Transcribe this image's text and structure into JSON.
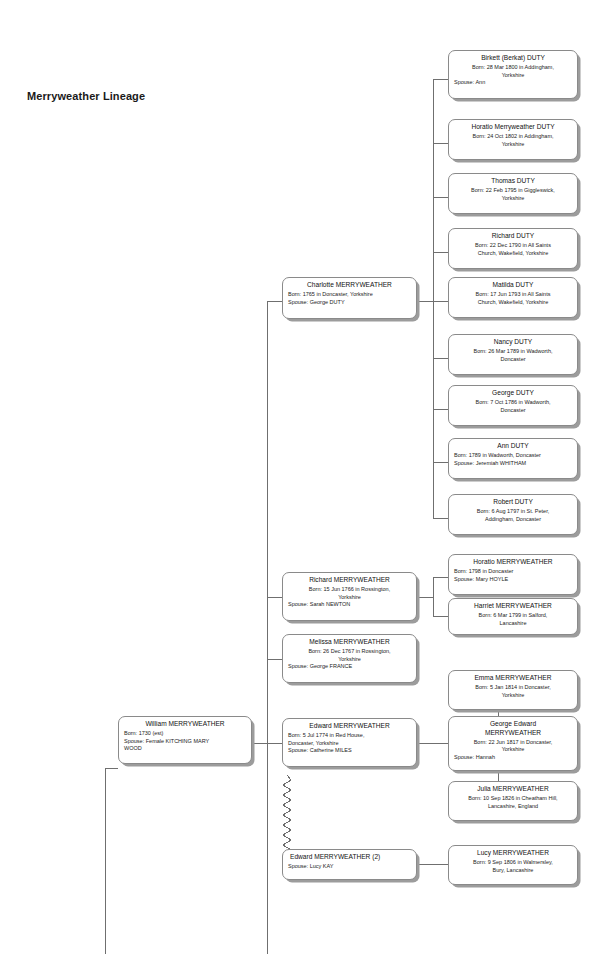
{
  "title": "Merryweather Lineage",
  "colors": {
    "box_border": "#8a8a8a",
    "box_fill": "#ffffff",
    "shadow": "#9c9c9c",
    "connector": "#6f6f6f",
    "text": "#111111"
  },
  "nodes": [
    {
      "id": "birkett-duty",
      "name": "Birkett (Berkat) DUTY",
      "born": "Born: 28 Mar 1800 in Addingham,\nYorkshire",
      "spouse": "Spouse: Ann"
    },
    {
      "id": "horatio-merryweather-duty",
      "name": "Horatio Merryweather DUTY",
      "born": "Born: 24 Oct 1802 in Addingham,\nYorkshire",
      "spouse": ""
    },
    {
      "id": "thomas-duty",
      "name": "Thomas DUTY",
      "born": "Born: 22 Feb 1795 in Giggleswick,\nYorkshire",
      "spouse": ""
    },
    {
      "id": "richard-duty",
      "name": "Richard DUTY",
      "born": "Born: 22 Dec 1790 in All Saints\nChurch, Wakefield, Yorkshire",
      "spouse": ""
    },
    {
      "id": "matilda-duty",
      "name": "Matilda DUTY",
      "born": "Born: 17 Jun 1793 in All Saints\nChurch, Wakefield, Yorkshire",
      "spouse": ""
    },
    {
      "id": "nancy-duty",
      "name": "Nancy DUTY",
      "born": "Born: 26 Mar 1789 in Wadworth,\nDoncaster",
      "spouse": ""
    },
    {
      "id": "george-duty",
      "name": "George DUTY",
      "born": "Born: 7 Oct 1786 in Wadworth,\nDoncaster",
      "spouse": ""
    },
    {
      "id": "ann-duty",
      "name": "Ann DUTY",
      "born": "Born: 1789 in Wadworth, Doncaster",
      "spouse": "Spouse: Jeremiah WHITHAM"
    },
    {
      "id": "robert-duty",
      "name": "Robert DUTY",
      "born": "Born: 6 Aug 1797 in St. Peter,\nAddingham, Doncaster",
      "spouse": ""
    },
    {
      "id": "charlotte-merryweather",
      "name": "Charlotte MERRYWEATHER",
      "born": "Born: 1765 in Doncaster, Yorkshire",
      "spouse": "Spouse: George DUTY"
    },
    {
      "id": "horatio-merryweather",
      "name": "Horatio MERRYWEATHER",
      "born": "Born: 1798 in Doncaster",
      "spouse": "Spouse: Mary HOYLE"
    },
    {
      "id": "harriet-merryweather",
      "name": "Harriet MERRYWEATHER",
      "born": "Born: 6 Mar 1799 in Salford,\nLancashire",
      "spouse": ""
    },
    {
      "id": "richard-merryweather",
      "name": "Richard MERRYWEATHER",
      "born": "Born: 15 Jun 1766 in Rossington,\nYorkshire",
      "spouse": "Spouse: Sarah NEWTON"
    },
    {
      "id": "melissa-merryweather",
      "name": "Melissa MERRYWEATHER",
      "born": "Born: 26 Dec 1767 in Rossington,\nYorkshire",
      "spouse": "Spouse: George FRANCE"
    },
    {
      "id": "emma-merryweather",
      "name": "Emma MERRYWEATHER",
      "born": "Born: 5 Jan 1814 in Doncaster,\nYorkshire",
      "spouse": ""
    },
    {
      "id": "george-edward-merryweather",
      "name": "George Edward\nMERRYWEATHER",
      "born": "Born: 22 Jun 1817 in Doncaster,\nYorkshire",
      "spouse": "Spouse: Hannah"
    },
    {
      "id": "julia-merryweather",
      "name": "Julia MERRYWEATHER",
      "born": "Born: 10 Sep 1826 in Cheatham Hill,\nLancashire, England",
      "spouse": ""
    },
    {
      "id": "william-merryweather",
      "name": "William MERRYWEATHER",
      "born": "Born: 1730 (est)",
      "spouse": "Spouse: Female KITCHING MARY\nWOOD"
    },
    {
      "id": "edward-merryweather",
      "name": "Edward MERRYWEATHER",
      "born": "Born: 5 Jul 1774 in Red House,\nDoncaster, Yorkshire",
      "spouse": "Spouse: Catherine MILES"
    },
    {
      "id": "edward-merryweather-2",
      "name": "Edward MERRYWEATHER (2)",
      "born": "",
      "spouse": "Spouse: Lucy KAY"
    },
    {
      "id": "lucy-merryweather",
      "name": "Lucy MERRYWEATHER",
      "born": "Born: 9 Sep 1806 in Walmersley,\nBury, Lancashire",
      "spouse": ""
    }
  ]
}
